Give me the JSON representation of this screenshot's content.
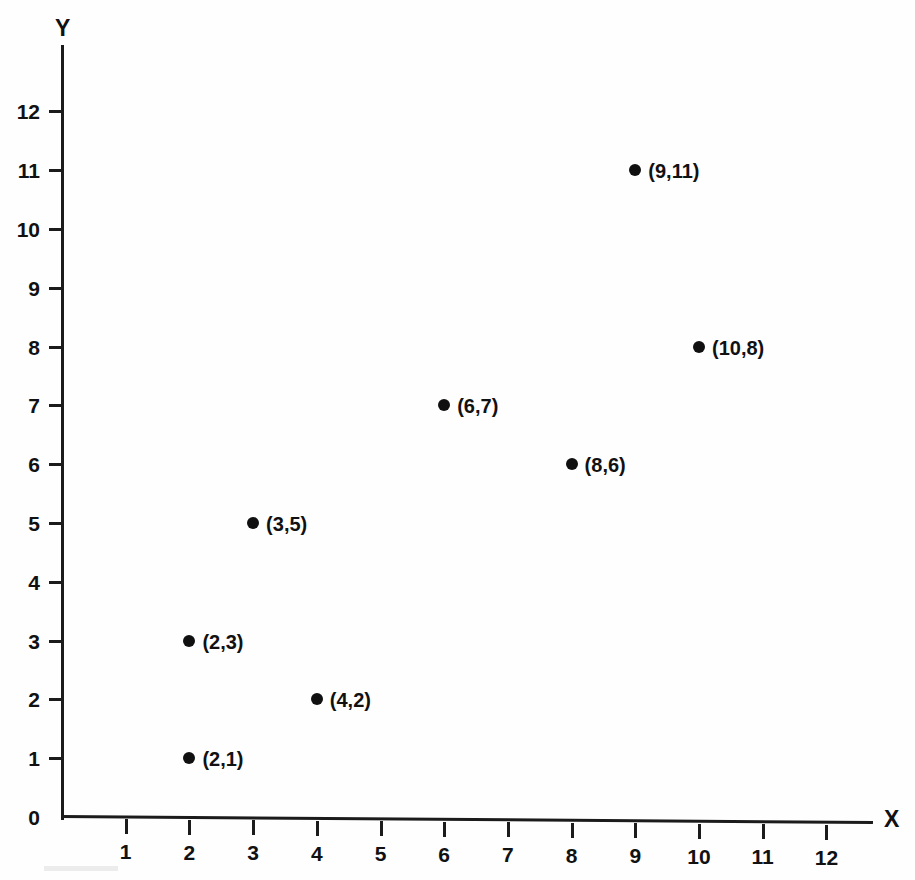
{
  "chart_data": {
    "type": "scatter",
    "title": "",
    "xlabel": "X",
    "ylabel": "Y",
    "xlim": [
      0,
      13
    ],
    "ylim": [
      0,
      13
    ],
    "grid": false,
    "legend": null,
    "x_ticks": [
      1,
      2,
      3,
      4,
      5,
      6,
      7,
      8,
      9,
      10,
      11,
      12
    ],
    "y_ticks": [
      0,
      1,
      2,
      3,
      4,
      5,
      6,
      7,
      8,
      9,
      10,
      11,
      12
    ],
    "x_tick_labels": [
      "1",
      "2",
      "3",
      "4",
      "5",
      "6",
      "7",
      "8",
      "9",
      "10",
      "11",
      "12"
    ],
    "y_tick_labels": [
      "0",
      "1",
      "2",
      "3",
      "4",
      "5",
      "6",
      "7",
      "8",
      "9",
      "10",
      "11",
      "12"
    ],
    "marker": "filled-circle",
    "marker_color": "#101010",
    "axis_color": "#1b1b1b",
    "background_color": "#fefefe",
    "points": [
      {
        "x": 2,
        "y": 1,
        "label": "(2,1)"
      },
      {
        "x": 2,
        "y": 3,
        "label": "(2,3)"
      },
      {
        "x": 3,
        "y": 5,
        "label": "(3,5)"
      },
      {
        "x": 4,
        "y": 2,
        "label": "(4,2)"
      },
      {
        "x": 6,
        "y": 7,
        "label": "(6,7)"
      },
      {
        "x": 8,
        "y": 6,
        "label": "(8,6)"
      },
      {
        "x": 9,
        "y": 11,
        "label": "(9,11)"
      },
      {
        "x": 10,
        "y": 8,
        "label": "(10,8)"
      }
    ]
  },
  "axes": {
    "y_title": "Y",
    "x_title": "X"
  }
}
